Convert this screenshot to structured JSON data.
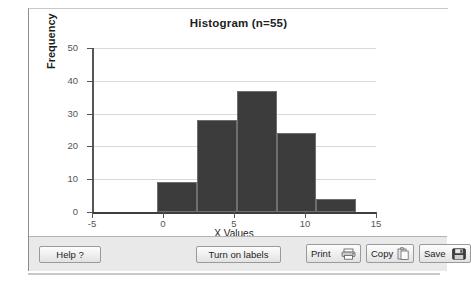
{
  "chart_data": {
    "type": "bar",
    "title": "Histogram (n=55)",
    "xlabel": "X Values",
    "ylabel": "Frequency",
    "xlim": [
      -5,
      15
    ],
    "ylim": [
      0,
      50
    ],
    "grid": true,
    "legend": "none",
    "xticks": [
      "-5",
      "0",
      "5",
      "10",
      "15"
    ],
    "xtick_values": [
      -5,
      0,
      5,
      10,
      15
    ],
    "yticks": [
      "0",
      "10",
      "20",
      "30",
      "40",
      "50"
    ],
    "ytick_values": [
      0,
      10,
      20,
      30,
      40,
      50
    ],
    "bin_edges": [
      -0.4,
      2.4,
      5.2,
      8.0,
      10.8,
      13.6
    ],
    "categories": [
      "-0.4 to 2.4",
      "2.4 to 5.2",
      "5.2 to 8.0",
      "8.0 to 10.8",
      "10.8 to 13.6"
    ],
    "values": [
      9,
      28,
      37,
      24,
      4
    ],
    "bar_color": "#3c3c3c",
    "bar_edge_color": "#6e6e6e",
    "gridline_color": "#d9d9d9"
  },
  "toolbar": {
    "help_label": "Help ?",
    "labels_toggle_label": "Turn on labels",
    "print_label": "Print",
    "copy_label": "Copy",
    "save_label": "Save"
  }
}
